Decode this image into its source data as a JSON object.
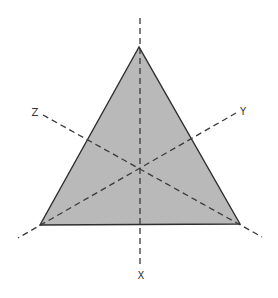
{
  "diagram": {
    "title": "",
    "colors": {
      "triangle_fill": "#b9b9b9",
      "triangle_stroke": "#2e2e2e",
      "axis_stroke": "#3a3a3a",
      "background": "#ffffff"
    },
    "triangle": {
      "vertices": [
        [
          139,
          47
        ],
        [
          40,
          225
        ],
        [
          240,
          224
        ]
      ]
    },
    "center": [
      140,
      167
    ],
    "axes": [
      {
        "name": "X",
        "label": "X",
        "from": [
          140,
          18
        ],
        "to": [
          140,
          266
        ],
        "label_pos": [
          141,
          279
        ]
      },
      {
        "name": "Y",
        "label": "Y",
        "from": [
          236,
          113
        ],
        "to": [
          18,
          238
        ],
        "label_pos": [
          242,
          115
        ]
      },
      {
        "name": "Z",
        "label": "Z",
        "from": [
          43,
          115
        ],
        "to": [
          262,
          237
        ],
        "label_pos": [
          35,
          115
        ]
      }
    ]
  }
}
